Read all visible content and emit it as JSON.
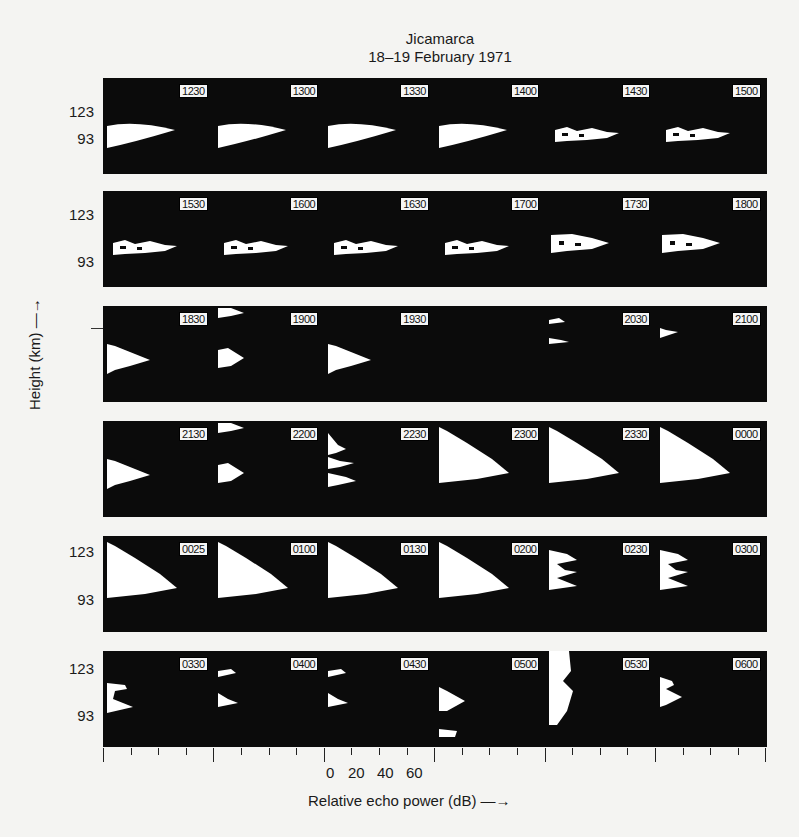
{
  "chart_data": {
    "type": "heatmap",
    "title": "Jicamarca",
    "subtitle": "18–19 February 1971",
    "xlabel": "Relative echo power (dB) →",
    "ylabel": "Height (km) →",
    "x_tick_labels": [
      "0",
      "20",
      "40",
      "60"
    ],
    "y_tick_labels": [
      "123",
      "93"
    ],
    "layout": "6 rows × 6 panels of range-time-intensity echo profiles; each panel labeled with local time",
    "rows": [
      {
        "y_labels": [
          "123",
          "93"
        ],
        "panels": [
          "1230",
          "1300",
          "1330",
          "1400",
          "1430",
          "1500"
        ]
      },
      {
        "y_labels": [
          "123",
          "93"
        ],
        "panels": [
          "1530",
          "1600",
          "1630",
          "1700",
          "1730",
          "1800"
        ]
      },
      {
        "y_labels": [],
        "panels": [
          "1830",
          "1900",
          "1930",
          "2000",
          "2030",
          "2100"
        ]
      },
      {
        "y_labels": [],
        "panels": [
          "2130",
          "2200",
          "2230",
          "2300",
          "2330",
          "0000"
        ]
      },
      {
        "y_labels": [
          "123",
          "93"
        ],
        "panels": [
          "0025",
          "0100",
          "0130",
          "0200",
          "0230",
          "0300"
        ]
      },
      {
        "y_labels": [
          "123",
          "93"
        ],
        "panels": [
          "0330",
          "0400",
          "0430",
          "0500",
          "0530",
          "0600"
        ]
      }
    ],
    "visible_time_labels_note": "panel '2000' has no printed label",
    "colors": {
      "background": "#0b0b0b",
      "echo": "#ffffff",
      "page": "#f4f4f2"
    }
  },
  "labels": {
    "title": "Jicamarca",
    "subtitle": "18–19 February 1971",
    "xlabel": "Relative echo power (dB) —→",
    "ylabel": "Height (km) —→",
    "x0": "0",
    "x20": "20",
    "x40": "40",
    "x60": "60",
    "y123": "123",
    "y93": "93"
  },
  "times": [
    [
      "1230",
      "1300",
      "1330",
      "1400",
      "1430",
      "1500"
    ],
    [
      "1530",
      "1600",
      "1630",
      "1700",
      "1730",
      "1800"
    ],
    [
      "1830",
      "1900",
      "1930",
      "",
      "2030",
      "2100"
    ],
    [
      "2130",
      "2200",
      "2230",
      "2300",
      "2330",
      "0000"
    ],
    [
      "0025",
      "0100",
      "0130",
      "0200",
      "0230",
      "0300"
    ],
    [
      "0330",
      "0400",
      "0430",
      "0500",
      "0530",
      "0600"
    ]
  ]
}
